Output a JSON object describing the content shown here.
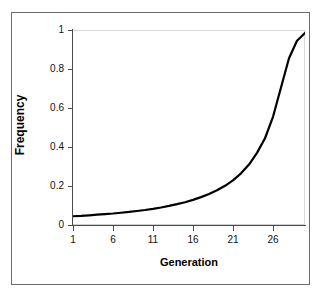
{
  "chart_data": {
    "type": "line",
    "title": "",
    "xlabel": "Generation",
    "ylabel": "Frequency",
    "xlim": [
      1,
      30
    ],
    "ylim": [
      0,
      1
    ],
    "grid": false,
    "legend": null,
    "x_ticks": [
      "1",
      "6",
      "11",
      "16",
      "21",
      "26"
    ],
    "x_tick_values": [
      1,
      6,
      11,
      16,
      21,
      26
    ],
    "y_ticks": [
      "0",
      "0.2",
      "0.4",
      "0.6",
      "0.8",
      "1"
    ],
    "y_tick_values": [
      0,
      0.2,
      0.4,
      0.6,
      0.8,
      1
    ],
    "line_color": "#000000",
    "line_width": 2.2,
    "series": [
      {
        "name": "Allele frequency",
        "x": [
          1,
          2,
          3,
          4,
          5,
          6,
          7,
          8,
          9,
          10,
          11,
          12,
          13,
          14,
          15,
          16,
          17,
          18,
          19,
          20,
          21,
          22,
          23,
          24,
          25,
          26,
          27,
          28,
          29,
          30
        ],
        "values": [
          0.05,
          0.052,
          0.055,
          0.058,
          0.061,
          0.064,
          0.068,
          0.072,
          0.077,
          0.082,
          0.088,
          0.095,
          0.103,
          0.112,
          0.122,
          0.134,
          0.148,
          0.164,
          0.183,
          0.206,
          0.234,
          0.27,
          0.315,
          0.375,
          0.45,
          0.56,
          0.71,
          0.86,
          0.95,
          0.99
        ]
      }
    ]
  },
  "axis_titles": {
    "x": "Generation",
    "y": "Frequency"
  }
}
